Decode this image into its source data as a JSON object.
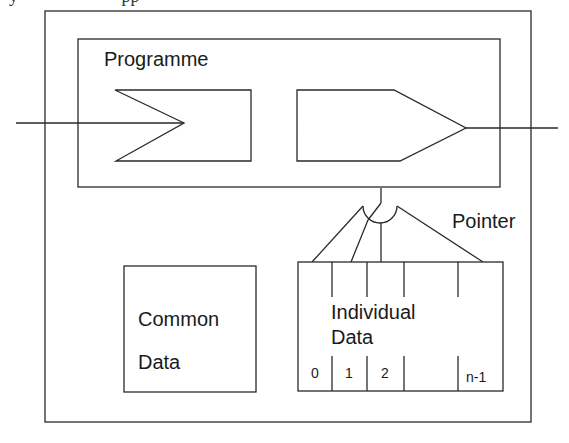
{
  "diagram": {
    "type": "software-structure",
    "labels": {
      "programme": "Programme",
      "pointer": "Pointer",
      "common_data_line1": "Common",
      "common_data_line2": "Data",
      "individual_data_line1": "Individual",
      "individual_data_line2": "Data"
    },
    "individual_data_slots": [
      "0",
      "1",
      "2",
      "",
      "n-1"
    ],
    "nodes": [
      {
        "id": "outer-module",
        "shape": "rect",
        "label": ""
      },
      {
        "id": "programme",
        "shape": "rect",
        "label": "Programme"
      },
      {
        "id": "input-port",
        "shape": "notched-rect"
      },
      {
        "id": "output-port",
        "shape": "pointed-rect"
      },
      {
        "id": "pointer",
        "shape": "switch-selector",
        "label": "Pointer"
      },
      {
        "id": "common-data",
        "shape": "rect",
        "label": "Common Data"
      },
      {
        "id": "individual-data",
        "shape": "segmented-rect",
        "label": "Individual Data"
      }
    ],
    "edges": [
      {
        "from": "external-left",
        "to": "input-port"
      },
      {
        "from": "output-port",
        "to": "external-right"
      },
      {
        "from": "programme",
        "to": "pointer"
      },
      {
        "from": "pointer",
        "to": "individual-data.0"
      },
      {
        "from": "pointer",
        "to": "individual-data.1"
      },
      {
        "from": "pointer",
        "to": "individual-data.2"
      },
      {
        "from": "pointer",
        "to": "individual-data.n-1"
      }
    ],
    "colors": {
      "line": "#2a2a2a",
      "text": "#1a1a1a",
      "background": "#ffffff"
    }
  }
}
